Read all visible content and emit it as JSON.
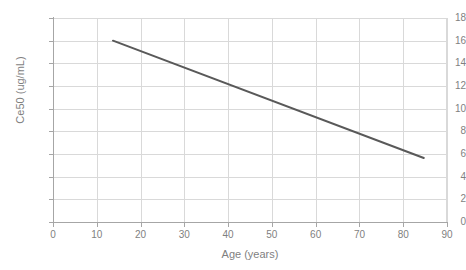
{
  "chart_data": {
    "type": "line",
    "title": "",
    "subtitle": "",
    "xlabel": "Age (years)",
    "ylabel": "Ce50 (ug/mL)",
    "xlim": [
      0,
      90
    ],
    "ylim": [
      0,
      18
    ],
    "xticks": [
      0,
      10,
      20,
      30,
      40,
      50,
      60,
      70,
      80,
      90
    ],
    "yticks": [
      0,
      2,
      4,
      6,
      8,
      10,
      12,
      14,
      16,
      18
    ],
    "xtick_labels": [
      "0",
      "10",
      "20",
      "30",
      "40",
      "50",
      "60",
      "70",
      "80",
      "90"
    ],
    "ytick_labels": [
      "0",
      "2",
      "4",
      "6",
      "8",
      "10",
      "12",
      "14",
      "16",
      "18"
    ],
    "grid": true,
    "grid_axis": "both",
    "legend": false,
    "legend_position": "none",
    "series": [
      {
        "name": "Ce50 vs Age",
        "color": "#595959",
        "line_width": 2,
        "markers": false,
        "x": [
          13.7,
          84.7
        ],
        "y": [
          16.0,
          5.65
        ]
      }
    ],
    "annotations": []
  },
  "axes": {
    "x_title": "Age (years)",
    "y_title": "Ce50 (ug/mL)"
  },
  "colors": {
    "line": "#595959",
    "grid": "#d9d9d9",
    "axis": "#a6a6a6",
    "tick_text": "#7f7f7f",
    "background": "#ffffff"
  }
}
